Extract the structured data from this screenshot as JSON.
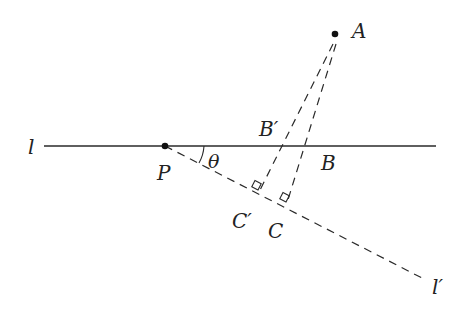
{
  "labels": {
    "l": "l",
    "l_prime": "l′",
    "P": "P",
    "A": "A",
    "B": "B",
    "B_prime": "B′",
    "C": "C",
    "C_prime": "C′",
    "theta": "θ"
  },
  "colors": {
    "stroke": "#2a2a2a",
    "background": "#ffffff"
  }
}
